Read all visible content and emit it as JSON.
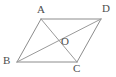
{
  "figure": {
    "kind": "geometry-diagram",
    "shape_name": "parallelogram",
    "background_color": "#ffffff",
    "stroke_color": "#8c8c8c",
    "diagonal_color": "#9a9a9a",
    "label_color": "#4d4d4d",
    "stroke_width": 1,
    "canvas": {
      "width": 116,
      "height": 77
    },
    "vertices": [
      {
        "id": "A",
        "label": "A",
        "x": 41,
        "y": 19,
        "label_x": 37,
        "label_y": 4
      },
      {
        "id": "D",
        "label": "D",
        "x": 101,
        "y": 19,
        "label_x": 102,
        "label_y": 3
      },
      {
        "id": "B",
        "label": "B",
        "x": 17,
        "y": 62,
        "label_x": 3,
        "label_y": 55
      },
      {
        "id": "C",
        "label": "C",
        "x": 77,
        "y": 62,
        "label_x": 73,
        "label_y": 63
      },
      {
        "id": "O",
        "label": "O",
        "x": 59,
        "y": 40.5,
        "label_x": 61,
        "label_y": 36
      }
    ],
    "edges": [
      {
        "id": "AD",
        "from": "A",
        "to": "D",
        "x1": 41,
        "y1": 19,
        "x2": 101,
        "y2": 19
      },
      {
        "id": "AB",
        "from": "A",
        "to": "B",
        "x1": 41,
        "y1": 19,
        "x2": 17,
        "y2": 62
      },
      {
        "id": "BC",
        "from": "B",
        "to": "C",
        "x1": 17,
        "y1": 62,
        "x2": 77,
        "y2": 62
      },
      {
        "id": "CD",
        "from": "C",
        "to": "D",
        "x1": 77,
        "y1": 62,
        "x2": 101,
        "y2": 19
      }
    ],
    "diagonals": [
      {
        "id": "AC",
        "from": "A",
        "to": "C",
        "x1": 41,
        "y1": 19,
        "x2": 77,
        "y2": 62
      },
      {
        "id": "BD",
        "from": "B",
        "to": "D",
        "x1": 17,
        "y1": 62,
        "x2": 101,
        "y2": 19
      }
    ]
  }
}
